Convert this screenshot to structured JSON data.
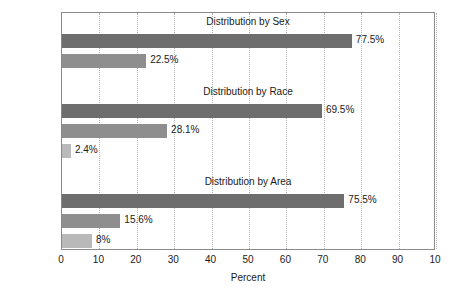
{
  "chart_data": {
    "type": "bar",
    "orientation": "horizontal",
    "title": "",
    "xlabel": "Percent",
    "ylabel": "",
    "xlim": [
      0,
      100
    ],
    "xticks": [
      0,
      10,
      20,
      30,
      40,
      50,
      60,
      70,
      80,
      90,
      100
    ],
    "xtick_labels": [
      "0",
      "10",
      "20",
      "30",
      "40",
      "50",
      "60",
      "70",
      "80",
      "90",
      "10"
    ],
    "grid": "vertical-dotted",
    "legend": "none",
    "groups": [
      {
        "title": "Distribution by Sex",
        "categories": [
          "Male",
          "Female"
        ],
        "values": [
          77.5,
          22.5
        ],
        "value_labels": [
          "77.5%",
          "22.5%"
        ],
        "shades": [
          "dark",
          "mid"
        ]
      },
      {
        "title": "Distribution by Race",
        "categories": [
          "White",
          "Black",
          "Other"
        ],
        "values": [
          69.5,
          28.1,
          2.4
        ],
        "value_labels": [
          "69.5%",
          "28.1%",
          "2.4%"
        ],
        "shades": [
          "dark",
          "mid",
          "light"
        ]
      },
      {
        "title": "Distribution by Area",
        "categories": [
          "Cities",
          "Suburbs",
          "Rural Areas"
        ],
        "values": [
          75.5,
          15.6,
          8.0
        ],
        "value_labels": [
          "75.5%",
          "15.6%",
          "8%"
        ],
        "shades": [
          "dark",
          "mid",
          "light"
        ]
      }
    ],
    "colors": {
      "bar_dark": "#6e6e6e",
      "bar_mid": "#8e8e8e",
      "bar_light": "#b9b9b9",
      "axis": "#8a8a8a",
      "gridline": "#b4b4b4",
      "text": "#1a1a1a",
      "background": "#ffffff"
    }
  }
}
